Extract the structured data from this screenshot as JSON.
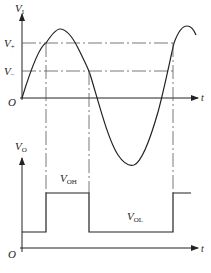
{
  "diagram": {
    "type": "comparator-hysteresis-waveforms",
    "upper_plot": {
      "y_axis_label": "V",
      "y_axis_subscript": "I",
      "x_axis_label": "t",
      "origin_label": "O",
      "thresholds": [
        {
          "label": "V",
          "subscript": "+",
          "y": 43
        },
        {
          "label": "V",
          "subscript": "−",
          "y": 71
        }
      ],
      "signal": "sine"
    },
    "lower_plot": {
      "y_axis_label": "V",
      "y_axis_subscript": "O",
      "x_axis_label": "t",
      "origin_label": "O",
      "levels": [
        {
          "label": "V",
          "subscript": "OH"
        },
        {
          "label": "V",
          "subscript": "OL"
        }
      ],
      "signal": "square"
    },
    "colors": {
      "stroke": "#222222",
      "guide": "#555555",
      "background": "#ffffff"
    }
  }
}
